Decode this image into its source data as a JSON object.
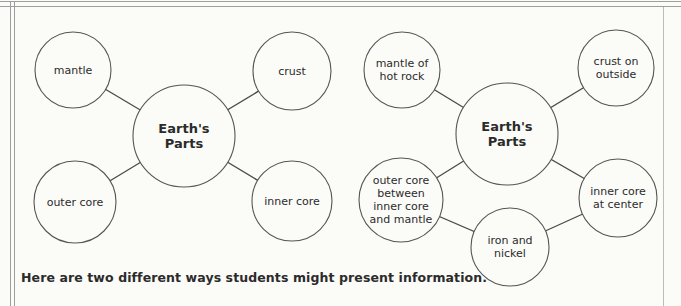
{
  "caption": {
    "text": "Here are two different ways students might present information."
  },
  "colors": {
    "background": "#fbfbf8",
    "node_fill": "#fbfbf8",
    "node_stroke": "#555555",
    "edge_stroke": "#4a4a4a",
    "text": "#2b2b2b",
    "frame_rule": "#9e9e9e",
    "frame_rule_light": "#bcbcbc"
  },
  "diagrams": [
    {
      "name": "concept-map-simple",
      "nodes": [
        {
          "id": "earths-parts-1",
          "label": [
            "Earth's",
            "Parts"
          ],
          "x": 184,
          "y": 136,
          "r": 51,
          "bold": true
        },
        {
          "id": "mantle",
          "label": [
            "mantle"
          ],
          "x": 73,
          "y": 70,
          "r": 38
        },
        {
          "id": "crust",
          "label": [
            "crust"
          ],
          "x": 292,
          "y": 71,
          "r": 39
        },
        {
          "id": "outer-core",
          "label": [
            "outer core"
          ],
          "x": 75,
          "y": 202,
          "r": 41
        },
        {
          "id": "inner-core",
          "label": [
            "inner core"
          ],
          "x": 292,
          "y": 201,
          "r": 40
        }
      ],
      "edges": [
        [
          "earths-parts-1",
          "mantle"
        ],
        [
          "earths-parts-1",
          "crust"
        ],
        [
          "earths-parts-1",
          "outer-core"
        ],
        [
          "earths-parts-1",
          "inner-core"
        ]
      ]
    },
    {
      "name": "concept-map-detailed",
      "nodes": [
        {
          "id": "earths-parts-2",
          "label": [
            "Earth's",
            "Parts"
          ],
          "x": 507,
          "y": 134,
          "r": 51,
          "bold": true
        },
        {
          "id": "mantle-of-hot-rock",
          "label": [
            "mantle of",
            "hot rock"
          ],
          "x": 402,
          "y": 70,
          "r": 38
        },
        {
          "id": "crust-on-outside",
          "label": [
            "crust on",
            "outside"
          ],
          "x": 616,
          "y": 68,
          "r": 38
        },
        {
          "id": "outer-core-between",
          "label": [
            "outer core",
            "between",
            "inner core",
            "and mantle"
          ],
          "x": 401,
          "y": 200,
          "r": 42
        },
        {
          "id": "inner-core-at-center",
          "label": [
            "inner core",
            "at center"
          ],
          "x": 618,
          "y": 198,
          "r": 39
        },
        {
          "id": "iron-and-nickel",
          "label": [
            "iron and",
            "nickel"
          ],
          "x": 510,
          "y": 247,
          "r": 39
        }
      ],
      "edges": [
        [
          "earths-parts-2",
          "mantle-of-hot-rock"
        ],
        [
          "earths-parts-2",
          "crust-on-outside"
        ],
        [
          "earths-parts-2",
          "outer-core-between"
        ],
        [
          "earths-parts-2",
          "inner-core-at-center"
        ],
        [
          "outer-core-between",
          "iron-and-nickel"
        ],
        [
          "iron-and-nickel",
          "inner-core-at-center"
        ]
      ]
    }
  ]
}
